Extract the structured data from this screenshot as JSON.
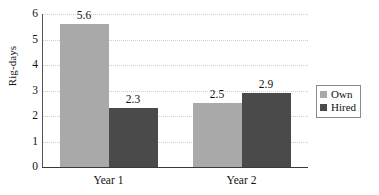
{
  "chart_data": {
    "type": "bar",
    "title": "",
    "subtitle": "",
    "xlabel": "",
    "ylabel": "Rig-days",
    "categories": [
      "Year 1",
      "Year 2"
    ],
    "series": [
      {
        "name": "Own",
        "values": [
          5.6,
          2.5
        ],
        "color": "#a9a9a9"
      },
      {
        "name": "Hired",
        "values": [
          2.3,
          2.9
        ],
        "color": "#4a4a4a"
      }
    ],
    "data_labels": [
      "5.6",
      "2.3",
      "2.5",
      "2.9"
    ],
    "ylim": [
      0,
      6
    ],
    "y_ticks": [
      0,
      1,
      2,
      3,
      4,
      5,
      6
    ],
    "y_tick_labels": [
      "0",
      "1",
      "2",
      "3",
      "4",
      "5",
      "6"
    ],
    "grid": "horizontal-dotted",
    "legend_position": "right",
    "legend_entries": [
      "Own",
      "Hired"
    ],
    "bar_group_gap": true,
    "annotations": []
  }
}
